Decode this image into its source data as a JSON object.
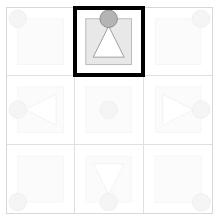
{
  "puzzle": {
    "type": "matrix-reasoning-3x3",
    "rows": 3,
    "columns": 3,
    "highlighted_cell_index": 1,
    "colors": {
      "frame_border": "#d8d8d8",
      "grid_line": "#e0e0e0",
      "square_fill": "#e8e8e8",
      "square_stroke": "#b8b8b8",
      "circle_fill": "#b4b4b4",
      "circle_stroke": "#8c8c8c",
      "triangle_fill": "#ffffff",
      "triangle_stroke": "#9a9a9a",
      "highlight_border": "#000000",
      "background": "#ffffff"
    },
    "faint_opacity": "0.13",
    "cells": [
      {
        "name": "cell-top-left",
        "row": 0,
        "column": 0,
        "square": true,
        "circle_position": "top-left-corner",
        "triangle": "none",
        "highlighted": false
      },
      {
        "name": "cell-top-center",
        "row": 0,
        "column": 1,
        "square": true,
        "circle_position": "top-center-edge",
        "triangle": "up",
        "highlighted": true
      },
      {
        "name": "cell-top-right",
        "row": 0,
        "column": 2,
        "square": true,
        "circle_position": "top-right-corner",
        "triangle": "none",
        "highlighted": false
      },
      {
        "name": "cell-middle-left",
        "row": 1,
        "column": 0,
        "square": true,
        "circle_position": "left-center-edge",
        "triangle": "left",
        "highlighted": false
      },
      {
        "name": "cell-middle-center",
        "row": 1,
        "column": 1,
        "square": true,
        "circle_position": "center",
        "triangle": "none",
        "highlighted": false
      },
      {
        "name": "cell-middle-right",
        "row": 1,
        "column": 2,
        "square": true,
        "circle_position": "right-center-edge",
        "triangle": "right",
        "highlighted": false
      },
      {
        "name": "cell-bottom-left",
        "row": 2,
        "column": 0,
        "square": true,
        "circle_position": "bottom-left-corner",
        "triangle": "none",
        "highlighted": false
      },
      {
        "name": "cell-bottom-center",
        "row": 2,
        "column": 1,
        "square": true,
        "circle_position": "bottom-center-edge",
        "triangle": "down",
        "highlighted": false
      },
      {
        "name": "cell-bottom-right",
        "row": 2,
        "column": 2,
        "square": true,
        "circle_position": "bottom-right-corner",
        "triangle": "none",
        "highlighted": false
      }
    ]
  }
}
